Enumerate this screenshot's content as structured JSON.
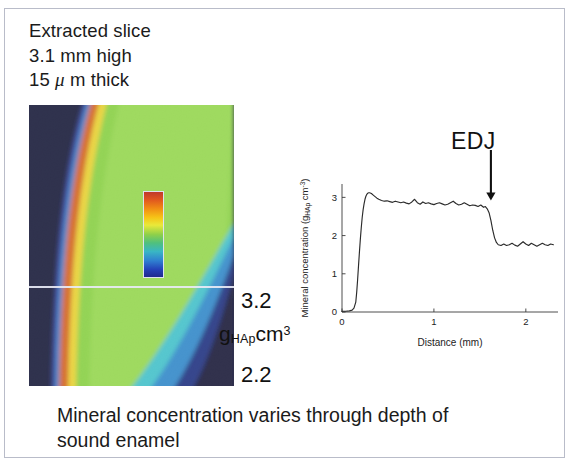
{
  "slide": {
    "header": {
      "line1": "Extracted slice",
      "line2": "3.1 mm high",
      "line3_prefix": "15 ",
      "line3_mu": "μ",
      "line3_suffix": " m thick"
    },
    "caption": {
      "line1": "Mineral concentration varies through depth of",
      "line2": "sound enamel"
    }
  },
  "tomogram": {
    "name": "enamel-slice-tomogram",
    "background_color": "#141736",
    "surface_band_color": "#d2601b",
    "bulk_color": "#86cf3f",
    "junction_color": "#3fc0c9",
    "scanline_color": "#e8eaf6"
  },
  "colorbar": {
    "max_label": "3.2",
    "min_label": "2.2",
    "unit_g": "g",
    "unit_sub": "HAp",
    "unit_cm": "cm",
    "unit_sup": "3",
    "gradient_top": "#c0392b",
    "gradient_bottom": "#202a8e"
  },
  "annotation": {
    "edj_label": "EDJ"
  },
  "chart_data": {
    "type": "line",
    "title": "",
    "xlabel": "Distance (mm)",
    "ylabel": "Mineral concentration (g",
    "ylabel_sub": "HAp",
    "ylabel_sup": " cm",
    "ylabel_sup2": "-3",
    "ylabel_close": ")",
    "xlim": [
      0,
      2.35
    ],
    "ylim": [
      0,
      3.35
    ],
    "xticks": [
      0,
      1,
      2
    ],
    "xticklabels": [
      "0",
      "1",
      "2"
    ],
    "yticks": [
      0,
      1,
      2,
      3
    ],
    "yticklabels": [
      "0",
      "1",
      "2",
      "3"
    ],
    "grid": false,
    "legend": "none",
    "line_color": "#2b2b2b",
    "annotations": [
      {
        "text": "EDJ",
        "x": 1.62,
        "y": 3.3,
        "arrow": "down"
      }
    ],
    "series": [
      {
        "name": "mineral concentration profile",
        "x": [
          0.0,
          0.04,
          0.08,
          0.11,
          0.13,
          0.15,
          0.16,
          0.17,
          0.18,
          0.19,
          0.2,
          0.21,
          0.22,
          0.23,
          0.24,
          0.25,
          0.26,
          0.27,
          0.28,
          0.29,
          0.3,
          0.32,
          0.34,
          0.36,
          0.38,
          0.4,
          0.43,
          0.46,
          0.49,
          0.52,
          0.55,
          0.58,
          0.61,
          0.64,
          0.67,
          0.7,
          0.73,
          0.76,
          0.79,
          0.82,
          0.85,
          0.88,
          0.91,
          0.94,
          0.97,
          1.0,
          1.03,
          1.06,
          1.09,
          1.12,
          1.15,
          1.18,
          1.21,
          1.24,
          1.27,
          1.3,
          1.33,
          1.36,
          1.39,
          1.42,
          1.45,
          1.48,
          1.51,
          1.54,
          1.56,
          1.58,
          1.6,
          1.62,
          1.64,
          1.66,
          1.68,
          1.7,
          1.73,
          1.76,
          1.79,
          1.82,
          1.85,
          1.88,
          1.91,
          1.94,
          1.97,
          2.0,
          2.03,
          2.06,
          2.09,
          2.12,
          2.15,
          2.18,
          2.21,
          2.24,
          2.27,
          2.3
        ],
        "y": [
          0.02,
          0.02,
          0.03,
          0.05,
          0.1,
          0.26,
          0.52,
          0.85,
          1.22,
          1.58,
          1.92,
          2.22,
          2.48,
          2.68,
          2.83,
          2.95,
          3.03,
          3.08,
          3.11,
          3.12,
          3.12,
          3.1,
          3.06,
          3.02,
          2.98,
          2.95,
          2.92,
          2.9,
          2.91,
          2.89,
          2.87,
          2.9,
          2.88,
          2.86,
          2.88,
          2.85,
          2.83,
          2.88,
          2.95,
          2.86,
          2.82,
          2.88,
          2.84,
          2.86,
          2.83,
          2.81,
          2.84,
          2.86,
          2.83,
          2.8,
          2.82,
          2.86,
          2.9,
          2.84,
          2.8,
          2.82,
          2.86,
          2.82,
          2.78,
          2.8,
          2.79,
          2.76,
          2.8,
          2.74,
          2.76,
          2.7,
          2.6,
          2.4,
          2.14,
          1.94,
          1.82,
          1.76,
          1.74,
          1.78,
          1.74,
          1.76,
          1.8,
          1.75,
          1.72,
          1.78,
          1.84,
          1.78,
          1.74,
          1.8,
          1.76,
          1.72,
          1.76,
          1.8,
          1.76,
          1.74,
          1.78,
          1.76
        ]
      }
    ]
  }
}
